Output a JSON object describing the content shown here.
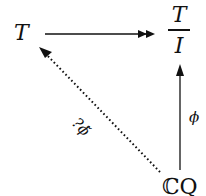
{
  "diagram": {
    "nodes": {
      "T": "T",
      "quotient_num": "T",
      "quotient_den": "I",
      "CQ": "ℂQ"
    },
    "edges": [
      {
        "from": "T",
        "to": "T/I",
        "style": "solid",
        "head": "double",
        "label": ""
      },
      {
        "from": "CQ",
        "to": "T/I",
        "style": "solid",
        "head": "single",
        "label": "ϕ"
      },
      {
        "from": "CQ",
        "to": "T",
        "style": "dotted",
        "head": "single",
        "label": "?ϕ̃"
      }
    ],
    "labels": {
      "phi": "ϕ",
      "phi_tilde": "?ϕ̃"
    }
  }
}
